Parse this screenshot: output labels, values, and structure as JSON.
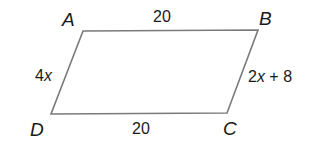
{
  "diagram": {
    "type": "parallelogram",
    "colors": {
      "edge": "#7a7a7a",
      "text": "#1a1a1a",
      "background": "#ffffff"
    },
    "vertices": [
      {
        "id": "A",
        "label": "A",
        "x": 83,
        "y": 31
      },
      {
        "id": "B",
        "label": "B",
        "x": 258,
        "y": 30
      },
      {
        "id": "C",
        "label": "C",
        "x": 227,
        "y": 113
      },
      {
        "id": "D",
        "label": "D",
        "x": 51,
        "y": 114
      }
    ],
    "sides": {
      "AB": {
        "label": "20"
      },
      "BC": {
        "label_prefix": "2",
        "label_var": "x",
        "label_suffix": " + 8"
      },
      "CD": {
        "label": "20"
      },
      "DA": {
        "label_prefix": "4",
        "label_var": "x"
      }
    }
  }
}
